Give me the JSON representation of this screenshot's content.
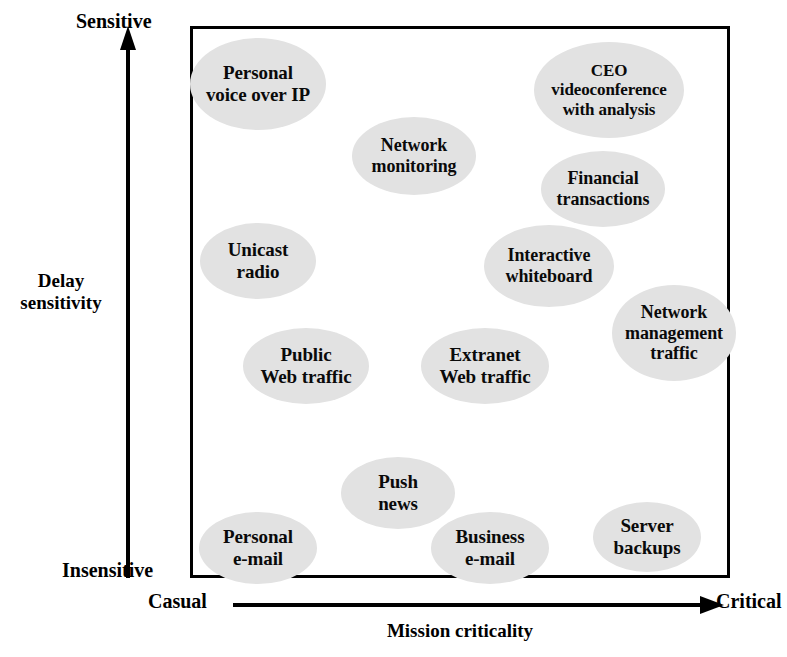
{
  "chart_data": {
    "type": "scatter",
    "title": "",
    "xlabel": "Mission criticality",
    "ylabel": "Delay sensitivity",
    "x_axis_low_label": "Casual",
    "x_axis_high_label": "Critical",
    "y_axis_low_label": "Insensitive",
    "y_axis_high_label": "Sensitive",
    "grid": false,
    "legend": "none",
    "bubble_color": "#e2e2e2",
    "frame_color": "#000000",
    "axis_color": "#000000",
    "xlim": [
      0,
      100
    ],
    "ylim": [
      0,
      100
    ],
    "note": "Qualitative positioning map; x = mission criticality (Casual to Critical), y = delay sensitivity (Insensitive to Sensitive). Values are percentages of the plot frame estimated from pixel positions.",
    "points": [
      {
        "label": "Personal voice over IP",
        "lines": [
          "Personal",
          "voice over IP"
        ],
        "x": 12,
        "y": 90,
        "w": 136,
        "h": 92,
        "font": 19
      },
      {
        "label": "CEO videoconference with analysis",
        "lines": [
          "CEO",
          "videoconference",
          "with analysis"
        ],
        "x": 77,
        "y": 89,
        "w": 150,
        "h": 96,
        "font": 17
      },
      {
        "label": "Network monitoring",
        "lines": [
          "Network",
          "monitoring"
        ],
        "x": 41,
        "y": 77,
        "w": 124,
        "h": 78,
        "font": 18
      },
      {
        "label": "Financial transactions",
        "lines": [
          "Financial",
          "transactions"
        ],
        "x": 76,
        "y": 71,
        "w": 124,
        "h": 76,
        "font": 18
      },
      {
        "label": "Unicast radio",
        "lines": [
          "Unicast",
          "radio"
        ],
        "x": 12,
        "y": 58,
        "w": 116,
        "h": 76,
        "font": 19
      },
      {
        "label": "Interactive whiteboard",
        "lines": [
          "Interactive",
          "whiteboard"
        ],
        "x": 66,
        "y": 57,
        "w": 130,
        "h": 82,
        "font": 18
      },
      {
        "label": "Network management traffic",
        "lines": [
          "Network",
          "management",
          "traffic"
        ],
        "x": 89,
        "y": 45,
        "w": 124,
        "h": 96,
        "font": 18
      },
      {
        "label": "Public Web traffic",
        "lines": [
          "Public",
          "Web traffic"
        ],
        "x": 21,
        "y": 39,
        "w": 126,
        "h": 76,
        "font": 19
      },
      {
        "label": "Extranet Web traffic",
        "lines": [
          "Extranet",
          "Web traffic"
        ],
        "x": 54,
        "y": 39,
        "w": 128,
        "h": 76,
        "font": 19
      },
      {
        "label": "Push news",
        "lines": [
          "Push",
          "news"
        ],
        "x": 38,
        "y": 16,
        "w": 114,
        "h": 72,
        "font": 19
      },
      {
        "label": "Personal e-mail",
        "lines": [
          "Personal",
          "e-mail"
        ],
        "x": 12,
        "y": 6,
        "w": 118,
        "h": 72,
        "font": 19
      },
      {
        "label": "Business e-mail",
        "lines": [
          "Business",
          "e-mail"
        ],
        "x": 55,
        "y": 6,
        "w": 118,
        "h": 72,
        "font": 19
      },
      {
        "label": "Server backups",
        "lines": [
          "Server",
          "backups"
        ],
        "x": 84,
        "y": 8,
        "w": 108,
        "h": 70,
        "font": 19
      }
    ]
  },
  "axes": {
    "y_top": "Sensitive",
    "y_bottom": "Insensitive",
    "y_title_line1": "Delay",
    "y_title_line2": "sensitivity",
    "x_left": "Casual",
    "x_right": "Critical",
    "x_title": "Mission criticality"
  }
}
